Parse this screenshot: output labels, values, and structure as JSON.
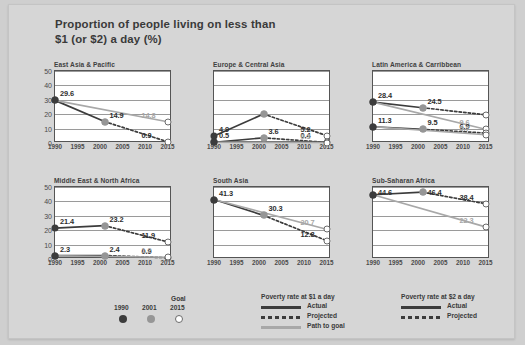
{
  "figure": {
    "title": "Proportion of people living on less than\n$1 (or $2) a day (%)",
    "title_line1": "Proportion of people living on less than",
    "title_line2": "$1 (or $2) a day (%)",
    "background_color": "#d6d6d6",
    "plot_background_color": "#ffffff",
    "color_actual": "#3c3c3c",
    "color_path_to_goal": "#a8a8a8",
    "color_marker_1990": "#3c3c3c",
    "color_marker_2001": "#969696",
    "color_marker_2015": "#ffffff"
  },
  "legend": {
    "goal_caption": "Goal",
    "year_labels": [
      "1990",
      "2001",
      "2015"
    ],
    "blocks": [
      {
        "heading": "Poverty rate at $1 a day",
        "rows": [
          {
            "label": "Actual",
            "style": "solid-dark"
          },
          {
            "label": "Projected",
            "style": "dotted-dark"
          },
          {
            "label": "Path to goal",
            "style": "solid-grey"
          }
        ]
      },
      {
        "heading": "Poverty rate at $2 a day",
        "rows": [
          {
            "label": "Actual",
            "style": "solid-dark"
          },
          {
            "label": "Projected",
            "style": "dotted-dark"
          }
        ]
      }
    ]
  },
  "chart_data": {
    "type": "line",
    "title": "Proportion of people living on less than $1 (or $2) a day (%)",
    "xlabel": "",
    "ylabel": "",
    "x": [
      1990,
      1995,
      2000,
      2005,
      2010,
      2015
    ],
    "xticklabels": [
      "1990",
      "1995",
      "2000",
      "2005",
      "2010",
      "2015"
    ],
    "xlim": [
      1990,
      2016
    ],
    "ylim": [
      0,
      50
    ],
    "yticks": [
      0,
      10,
      20,
      30,
      40,
      50
    ],
    "yticklabels": [
      "0",
      "10",
      "20",
      "30",
      "40",
      "50"
    ],
    "grid": true,
    "legend_position": "bottom",
    "marker_years": [
      1990,
      2001,
      2015
    ],
    "panels": [
      {
        "name": "East Asia & Pacific",
        "series": [
          {
            "name": "Poverty rate at $1 a day - actual",
            "style": "solid-dark",
            "points": [
              {
                "year": 1990,
                "value": 29.6,
                "label": "29.6"
              },
              {
                "year": 2001,
                "value": 14.9,
                "label": "14.9"
              }
            ]
          },
          {
            "name": "Poverty rate at $1 a day - projected",
            "style": "dotted-dark",
            "points": [
              {
                "year": 2001,
                "value": 14.9,
                "label": ""
              },
              {
                "year": 2015,
                "value": 0.9,
                "label": "0.9"
              }
            ]
          },
          {
            "name": "Poverty rate at $1 a day - path to goal",
            "style": "solid-grey",
            "points": [
              {
                "year": 1990,
                "value": 29.6,
                "label": ""
              },
              {
                "year": 2015,
                "value": 14.8,
                "label": "14.8"
              }
            ]
          }
        ]
      },
      {
        "name": "Europe & Central Asia",
        "series": [
          {
            "name": "Poverty rate at $2 a day - actual",
            "style": "solid-dark",
            "points": [
              {
                "year": 1990,
                "value": 4.9,
                "label": "4.9"
              },
              {
                "year": 2001,
                "value": 20.1,
                "label": ""
              }
            ]
          },
          {
            "name": "Poverty rate at $2 a day - projected",
            "style": "dotted-dark",
            "points": [
              {
                "year": 2001,
                "value": 20.1,
                "label": ""
              },
              {
                "year": 2015,
                "value": 5.2,
                "label": "5.2"
              }
            ]
          },
          {
            "name": "Poverty rate at $1 a day - actual",
            "style": "solid-dark",
            "points": [
              {
                "year": 1990,
                "value": 0.5,
                "label": "0.5"
              },
              {
                "year": 2001,
                "value": 3.6,
                "label": "3.6"
              }
            ]
          },
          {
            "name": "Poverty rate at $1 a day - projected",
            "style": "dotted-dark",
            "points": [
              {
                "year": 2001,
                "value": 3.6,
                "label": ""
              },
              {
                "year": 2015,
                "value": 0.4,
                "label": "0.4"
              }
            ]
          },
          {
            "name": "Poverty rate at $1 a day - path to goal",
            "style": "solid-grey",
            "points": [
              {
                "year": 1990,
                "value": 0.5,
                "label": ""
              },
              {
                "year": 2015,
                "value": 0.3,
                "label": "0.3"
              }
            ]
          }
        ]
      },
      {
        "name": "Latin America & Carribbean",
        "series": [
          {
            "name": "Poverty rate at $2 a day - actual",
            "style": "solid-dark",
            "points": [
              {
                "year": 1990,
                "value": 28.4,
                "label": "28.4"
              },
              {
                "year": 2001,
                "value": 24.5,
                "label": "24.5"
              }
            ]
          },
          {
            "name": "Poverty rate at $2 a day - projected",
            "style": "dotted-dark",
            "points": [
              {
                "year": 2001,
                "value": 24.5,
                "label": ""
              },
              {
                "year": 2015,
                "value": 19.6,
                "label": ""
              }
            ]
          },
          {
            "name": "Poverty rate at $2 a day - path to goal",
            "style": "solid-grey",
            "points": [
              {
                "year": 1990,
                "value": 28.4,
                "label": ""
              },
              {
                "year": 2015,
                "value": 9.6,
                "label": "9.6"
              }
            ]
          },
          {
            "name": "Poverty rate at $1 a day - actual",
            "style": "solid-dark",
            "points": [
              {
                "year": 1990,
                "value": 11.3,
                "label": "11.3"
              },
              {
                "year": 2001,
                "value": 9.5,
                "label": "9.5"
              }
            ]
          },
          {
            "name": "Poverty rate at $1 a day - projected",
            "style": "dotted-dark",
            "points": [
              {
                "year": 2001,
                "value": 9.5,
                "label": ""
              },
              {
                "year": 2015,
                "value": 6.9,
                "label": "6.9"
              }
            ]
          },
          {
            "name": "Poverty rate at $1 a day - path to goal",
            "style": "solid-grey",
            "points": [
              {
                "year": 1990,
                "value": 11.3,
                "label": ""
              },
              {
                "year": 2015,
                "value": 5.7,
                "label": "5.7"
              }
            ]
          }
        ]
      },
      {
        "name": "Middle East & North Africa",
        "series": [
          {
            "name": "Poverty rate at $2 a day - actual",
            "style": "solid-dark",
            "points": [
              {
                "year": 1990,
                "value": 21.4,
                "label": "21.4"
              },
              {
                "year": 2001,
                "value": 23.2,
                "label": "23.2"
              }
            ]
          },
          {
            "name": "Poverty rate at $2 a day - projected",
            "style": "dotted-dark",
            "points": [
              {
                "year": 2001,
                "value": 23.2,
                "label": ""
              },
              {
                "year": 2015,
                "value": 11.9,
                "label": "11.9"
              }
            ]
          },
          {
            "name": "Poverty rate at $1 a day - actual",
            "style": "solid-dark",
            "points": [
              {
                "year": 1990,
                "value": 2.3,
                "label": "2.3"
              },
              {
                "year": 2001,
                "value": 2.4,
                "label": "2.4"
              }
            ]
          },
          {
            "name": "Poverty rate at $1 a day - projected",
            "style": "dotted-dark",
            "points": [
              {
                "year": 2001,
                "value": 2.4,
                "label": ""
              },
              {
                "year": 2015,
                "value": 0.9,
                "label": "0.9"
              }
            ]
          },
          {
            "name": "Poverty rate at $1 a day - path to goal",
            "style": "solid-grey",
            "points": [
              {
                "year": 1990,
                "value": 2.3,
                "label": ""
              },
              {
                "year": 2015,
                "value": 1.2,
                "label": "1.2"
              }
            ]
          }
        ]
      },
      {
        "name": "South Asia",
        "series": [
          {
            "name": "Poverty rate at $1 a day - actual",
            "style": "solid-dark",
            "points": [
              {
                "year": 1990,
                "value": 41.3,
                "label": "41.3"
              },
              {
                "year": 2001,
                "value": 30.3,
                "label": "30.3"
              }
            ]
          },
          {
            "name": "Poverty rate at $1 a day - projected",
            "style": "dotted-dark",
            "points": [
              {
                "year": 2001,
                "value": 30.3,
                "label": ""
              },
              {
                "year": 2015,
                "value": 12.8,
                "label": "12.8"
              }
            ]
          },
          {
            "name": "Poverty rate at $1 a day - path to goal",
            "style": "solid-grey",
            "points": [
              {
                "year": 1990,
                "value": 41.3,
                "label": ""
              },
              {
                "year": 2015,
                "value": 20.7,
                "label": "20.7"
              }
            ]
          }
        ]
      },
      {
        "name": "Sub-Saharan Africa",
        "series": [
          {
            "name": "Poverty rate at $1 a day - actual",
            "style": "solid-dark",
            "points": [
              {
                "year": 1990,
                "value": 44.6,
                "label": "44.6"
              },
              {
                "year": 2001,
                "value": 46.4,
                "label": "46.4"
              }
            ]
          },
          {
            "name": "Poverty rate at $1 a day - projected",
            "style": "dotted-dark",
            "points": [
              {
                "year": 2001,
                "value": 46.4,
                "label": ""
              },
              {
                "year": 2015,
                "value": 38.4,
                "label": "38.4"
              }
            ]
          },
          {
            "name": "Poverty rate at $1 a day - path to goal",
            "style": "solid-grey",
            "points": [
              {
                "year": 1990,
                "value": 44.6,
                "label": ""
              },
              {
                "year": 2015,
                "value": 22.3,
                "label": "22.3"
              }
            ]
          }
        ]
      }
    ]
  }
}
